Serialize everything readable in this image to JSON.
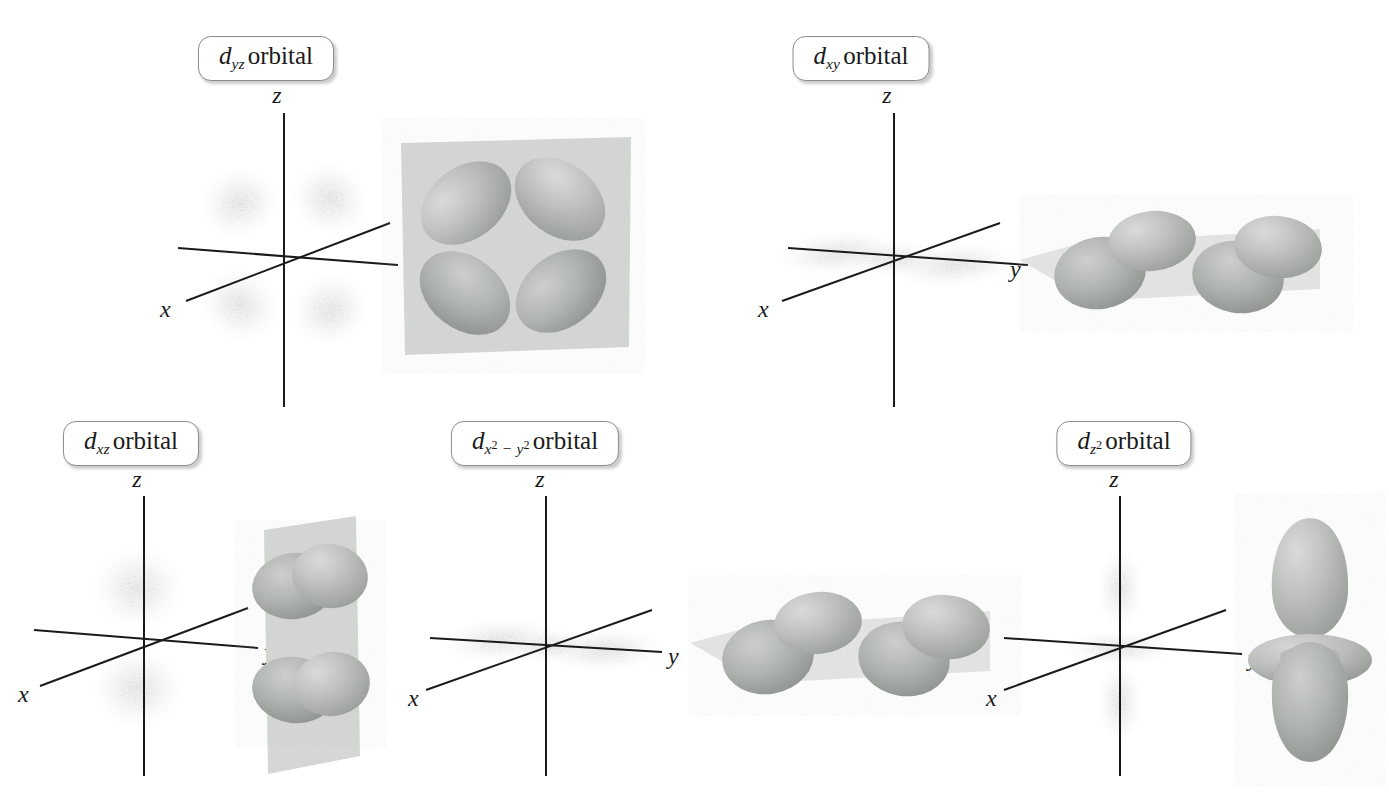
{
  "figure": {
    "background_color": "#ffffff",
    "ink_color": "#1a1a1a",
    "cloud_color": "#9a9a9a",
    "lobe_color": "#b9bcb9",
    "plane_color": "#d3d6d3"
  },
  "axes": {
    "x_label": "x",
    "y_label": "y",
    "z_label": "z"
  },
  "panels": [
    {
      "id": "dyz",
      "label": {
        "d": "d",
        "sub": "yz",
        "word": "orbital"
      },
      "label_text": "d_yz orbital",
      "cloud_type": "four-lobe-diagonal-yz",
      "render_type": "four-lobe-plane-faceon",
      "has_plane": true,
      "lobe_count": 4
    },
    {
      "id": "dxy",
      "label": {
        "d": "d",
        "sub": "xy",
        "word": "orbital"
      },
      "label_text": "d_xy orbital",
      "cloud_type": "horizontal-band",
      "render_type": "four-lobe-horizontal",
      "has_plane": true,
      "lobe_count": 4
    },
    {
      "id": "dxz",
      "label": {
        "d": "d",
        "sub": "xz",
        "word": "orbital"
      },
      "label_text": "d_xz orbital",
      "cloud_type": "two-lobe-vertical-xz",
      "render_type": "four-lobe-vertical-plane",
      "has_plane": true,
      "lobe_count": 4
    },
    {
      "id": "dx2y2",
      "label": {
        "d": "d",
        "sub": "x2 − y2",
        "word": "orbital"
      },
      "label_text": "d_x2-y2 orbital",
      "cloud_type": "horizontal-band",
      "render_type": "four-lobe-horizontal",
      "has_plane": true,
      "lobe_count": 4
    },
    {
      "id": "dz2",
      "label": {
        "d": "d",
        "sub": "z2",
        "word": "orbital"
      },
      "label_text": "d_z2 orbital",
      "cloud_type": "vertical-lobes-with-band",
      "render_type": "two-lobe-with-torus",
      "has_plane": false,
      "lobe_count": 2
    }
  ]
}
